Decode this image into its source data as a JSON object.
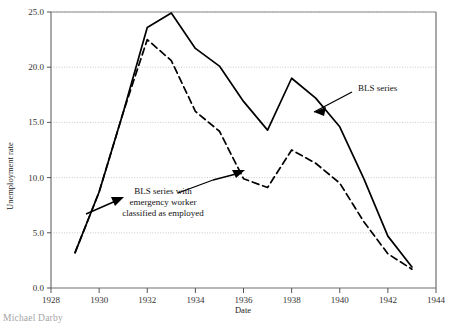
{
  "figure": {
    "background_color": "#ffffff",
    "caption_partial": "Michael Darby"
  },
  "axes": {
    "x": {
      "label": "Date",
      "ticks": [
        "1928",
        "1930",
        "1932",
        "1934",
        "1936",
        "1938",
        "1940",
        "1942",
        "1944"
      ],
      "min": 1928,
      "max": 1944
    },
    "y": {
      "label": "Unemployment rate",
      "ticks": [
        "0.0",
        "5.0",
        "10.0",
        "15.0",
        "20.0",
        "25.0"
      ],
      "min": 0,
      "max": 25
    }
  },
  "annotations": [
    {
      "name": "bls-series-annotation",
      "lines": [
        "BLS series"
      ],
      "x": 358,
      "y": 88
    },
    {
      "name": "bls-emergency-annotation",
      "lines": [
        "BLS series with",
        "emergency worker",
        "classified as employed"
      ],
      "x": 100,
      "y": 192
    }
  ],
  "chart_data": {
    "type": "line",
    "title": "",
    "xlabel": "Date",
    "ylabel": "Unemployment rate",
    "xlim": [
      1928,
      1944
    ],
    "ylim": [
      0.0,
      25.0
    ],
    "grid": true,
    "grid_axis": "y",
    "legend": "annotations-with-arrows",
    "x": [
      1929,
      1930,
      1931,
      1932,
      1933,
      1934,
      1935,
      1936,
      1937,
      1938,
      1939,
      1940,
      1941,
      1942,
      1943
    ],
    "series": [
      {
        "name": "BLS series",
        "style": "solid",
        "color": "#000000",
        "values": [
          3.2,
          8.7,
          15.9,
          23.6,
          24.9,
          21.7,
          20.1,
          16.9,
          14.3,
          19.0,
          17.2,
          14.6,
          9.9,
          4.7,
          1.9
        ]
      },
      {
        "name": "BLS series with emergency worker classified as employed",
        "style": "dashed",
        "color": "#000000",
        "values": [
          3.2,
          8.7,
          15.9,
          22.5,
          20.6,
          16.0,
          14.2,
          9.9,
          9.1,
          12.5,
          11.3,
          9.5,
          6.0,
          3.1,
          1.7
        ]
      }
    ]
  }
}
